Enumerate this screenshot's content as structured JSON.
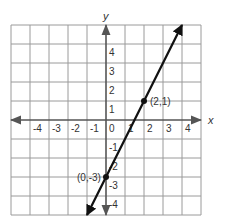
{
  "chart_data": {
    "type": "line",
    "title": "",
    "xlabel": "x",
    "ylabel": "y",
    "xlim": [
      -5,
      5
    ],
    "ylim": [
      -5,
      5
    ],
    "grid": true,
    "x_ticks": [
      -4,
      -3,
      -2,
      -1,
      0,
      1,
      2,
      3,
      4
    ],
    "y_ticks": [
      -4,
      -3,
      -2,
      -1,
      1,
      2,
      3,
      4
    ],
    "x_tick_labels": [
      "-4",
      "-3",
      "-2",
      "-1",
      "0",
      "1",
      "2",
      "3",
      "4"
    ],
    "y_tick_labels": [
      "-4",
      "-3",
      "-2",
      "-1",
      "1",
      "2",
      "3",
      "4"
    ],
    "series": [
      {
        "name": "line",
        "equation": "y = 2x - 3",
        "x": [
          -1,
          4
        ],
        "y": [
          -5,
          5
        ],
        "arrows": "both"
      }
    ],
    "points": [
      {
        "x": 2,
        "y": 1,
        "label": "(2,1)"
      },
      {
        "x": 0,
        "y": -3,
        "label": "(0,-3)"
      }
    ]
  },
  "colors": {
    "grid": "#9a9a9a",
    "axis": "#555555",
    "line": "#111111",
    "text": "#333333"
  }
}
